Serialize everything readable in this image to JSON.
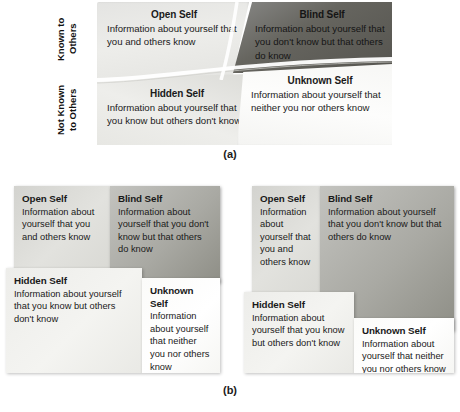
{
  "figure": {
    "axis_labels": {
      "known_to_others": "Known to\nOthers",
      "not_known_to_others": "Not Known\nto Others"
    },
    "captions": {
      "a": "(a)",
      "b": "(b)"
    }
  },
  "panel_a": {
    "open": {
      "title": "Open Self",
      "body": "Information about yourself that you and others know"
    },
    "blind": {
      "title": "Blind Self",
      "body": "Information about yourself that you don't know but that others do know"
    },
    "hidden": {
      "title": "Hidden Self",
      "body": "Information about yourself that you know but others don't know"
    },
    "unknown": {
      "title": "Unknown Self",
      "body": "Information about yourself that neither you nor others know"
    }
  },
  "panel_b_left": {
    "open": {
      "title": "Open Self",
      "body": "Information about yourself that you and others know"
    },
    "blind": {
      "title": "Blind Self",
      "body": "Information about yourself that you don't know but that others do know"
    },
    "hidden": {
      "title": "Hidden Self",
      "body": "Information about yourself that you know but others don't know"
    },
    "unknown": {
      "title": "Unknown Self",
      "body": "Information about yourself that neither you nor others know"
    }
  },
  "panel_b_right": {
    "open": {
      "title": "Open Self",
      "body": "Information about yourself that you and others know"
    },
    "blind": {
      "title": "Blind Self",
      "body": "Information about yourself that you don't know but  that others do know"
    },
    "hidden": {
      "title": "Hidden Self",
      "body": "Information about yourself that you know but others don't know"
    },
    "unknown": {
      "title": "Unknown Self",
      "body": "Information about yourself that neither you nor others know"
    }
  },
  "colors": {
    "blind_dark": "#55544f",
    "blind_mid": "#8e8e86",
    "open_gray": "#d9d9d4",
    "hidden_light": "#eeeeeb",
    "unknown_white": "#fdfdfc",
    "text": "#1a1a1a"
  }
}
